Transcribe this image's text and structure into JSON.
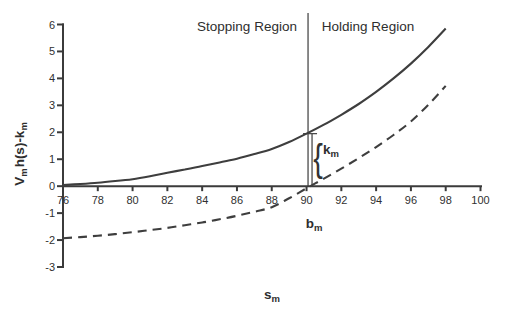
{
  "chart_data": {
    "type": "line",
    "xlabel_parts": {
      "base": "s",
      "sub": "m"
    },
    "ylabel_parts": {
      "base1": "V",
      "sub1": "m",
      "base2": "h(s)-k",
      "sub2": "m"
    },
    "xlim": [
      76,
      100
    ],
    "ylim": [
      -3,
      6
    ],
    "x_ticks": [
      76,
      78,
      80,
      82,
      84,
      86,
      88,
      90,
      92,
      94,
      96,
      98,
      100
    ],
    "y_ticks": [
      6,
      5,
      4,
      3,
      2,
      1,
      0,
      -1,
      -2,
      -3
    ],
    "grid": false,
    "legend": false,
    "region_divider_x": 90,
    "series": [
      {
        "name": "solid-curve",
        "line_style": "solid",
        "x": [
          76,
          77,
          78,
          79,
          80,
          81,
          82,
          83,
          84,
          85,
          86,
          87,
          88,
          89,
          90,
          91,
          92,
          93,
          94,
          95,
          96,
          97,
          98
        ],
        "y": [
          0.04,
          0.08,
          0.13,
          0.19,
          0.26,
          0.37,
          0.5,
          0.62,
          0.75,
          0.88,
          1.02,
          1.19,
          1.38,
          1.64,
          1.95,
          2.28,
          2.65,
          3.05,
          3.5,
          4.0,
          4.55,
          5.17,
          5.85
        ]
      },
      {
        "name": "dashed-curve",
        "line_style": "dashed",
        "x": [
          76,
          77,
          78,
          79,
          80,
          81,
          82,
          83,
          84,
          85,
          86,
          87,
          88,
          89,
          90,
          91,
          92,
          93,
          94,
          95,
          96,
          97,
          98
        ],
        "y": [
          -1.93,
          -1.89,
          -1.84,
          -1.78,
          -1.71,
          -1.63,
          -1.55,
          -1.45,
          -1.35,
          -1.23,
          -1.1,
          -0.95,
          -0.78,
          -0.45,
          -0.08,
          0.28,
          0.65,
          1.04,
          1.45,
          1.9,
          2.4,
          3.02,
          3.72
        ]
      }
    ],
    "annotations": {
      "stopping_region": "Stopping Region",
      "holding_region": "Holding Region",
      "b_label": {
        "base": "b",
        "sub": "m"
      },
      "k_label": {
        "base": "k",
        "sub": "m"
      },
      "brace": "{",
      "k_marker_x": 90
    }
  },
  "colors": {
    "background": "#ffffff",
    "axis": "#3b3b3b",
    "curve": "#3e3e3e",
    "divider": "#4a4a4a",
    "text": "#2e2e2e"
  }
}
